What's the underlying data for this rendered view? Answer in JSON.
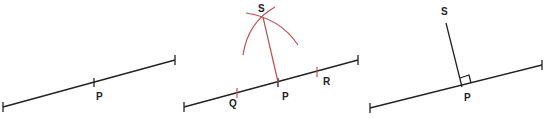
{
  "diagram": {
    "colors": {
      "line": "#222222",
      "construction": "#c0504d",
      "background": "#ffffff"
    },
    "panels": [
      {
        "step": 1,
        "description": "Line with point P marked",
        "labels": {
          "P": "P"
        }
      },
      {
        "step": 2,
        "description": "Arcs from Q and R intersect at S; S joined to P",
        "labels": {
          "S": "S",
          "Q": "Q",
          "P": "P",
          "R": "R"
        }
      },
      {
        "step": 3,
        "description": "SP perpendicular to line at P with right-angle mark",
        "labels": {
          "S": "S",
          "P": "P"
        }
      }
    ]
  }
}
